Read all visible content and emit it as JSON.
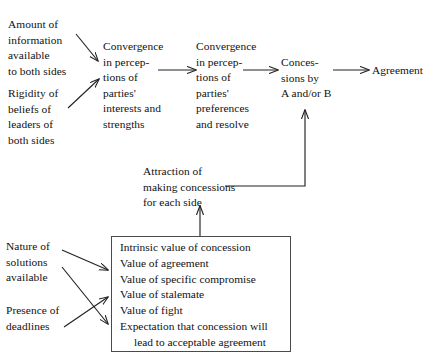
{
  "diagram": {
    "stroke_color": "#222222",
    "box_border_color": "#4a4a4a",
    "background_color": "#ffffff",
    "nodes": {
      "amount_of_information": "Amount of\ninformation\navailable\nto both sides",
      "rigidity_of_beliefs": "Rigidity of\nbeliefs of\nleaders of\nboth sides",
      "convergence_interests": "Convergence\nin percep-\ntions of\nparties'\ninterests and\nstrengths",
      "convergence_preferences": "Convergence\nin percep-\ntions of\nparties'\npreferences\nand resolve",
      "concessions": "Conces-\nsions by\nA and/or B",
      "agreement": "Agreement",
      "attraction": "Attraction of\nmaking concessions\nfor each side",
      "nature_of_solutions": "Nature of\nsolutions\navailable",
      "presence_of_deadlines": "Presence of\ndeadlines"
    },
    "factor_box": {
      "items": [
        "Intrinsic value of concession",
        "Value of agreement",
        "Value of specific compromise",
        "Value of stalemate",
        "Value of fight",
        "Expectation that concession will",
        "lead to acceptable agreement"
      ]
    }
  }
}
